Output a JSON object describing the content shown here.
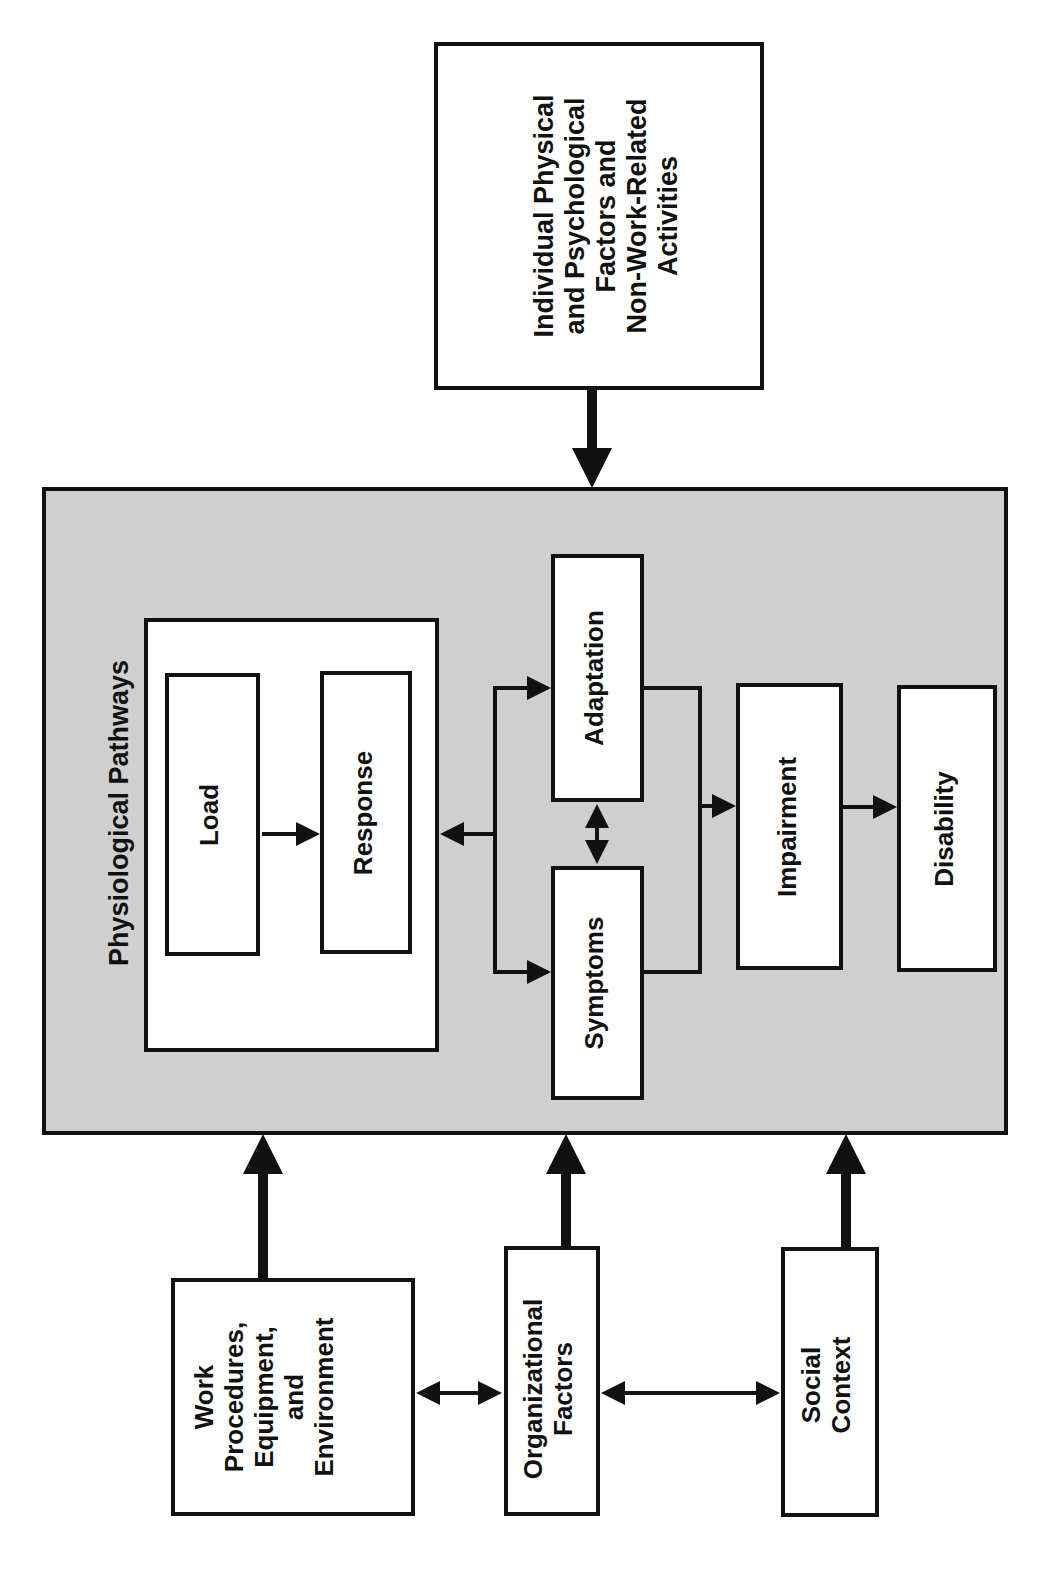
{
  "diagram": {
    "orientation": "rotated -90deg",
    "container": {
      "title": "Physiological Pathways",
      "fill": "#cfcfcf"
    },
    "nodes": {
      "individual": "Individual Physical\nand Psychological\nFactors and\nNon-Work-Related\nActivities",
      "load": "Load",
      "response": "Response",
      "adaptation": "Adaptation",
      "symptoms": "Symptoms",
      "impairment": "Impairment",
      "disability": "Disability",
      "work": "Work\nProcedures,\nEquipment,\nand\nEnvironment",
      "organizational": "Organizational\nFactors",
      "social": "Social\nContext"
    },
    "edges": [
      {
        "from": "individual",
        "to": "physiological-pathways",
        "style": "thick"
      },
      {
        "from": "work",
        "to": "physiological-pathways",
        "style": "thick"
      },
      {
        "from": "organizational",
        "to": "physiological-pathways",
        "style": "thick"
      },
      {
        "from": "social",
        "to": "physiological-pathways",
        "style": "thick"
      },
      {
        "from": "load",
        "to": "response"
      },
      {
        "from": "branch",
        "to": "response"
      },
      {
        "from": "branch",
        "to": "adaptation"
      },
      {
        "from": "branch",
        "to": "symptoms"
      },
      {
        "from": "adaptation",
        "to": "symptoms",
        "bidirectional": true
      },
      {
        "from": "adaptation+symptoms",
        "to": "impairment"
      },
      {
        "from": "impairment",
        "to": "disability"
      },
      {
        "from": "work",
        "to": "organizational",
        "bidirectional": true
      },
      {
        "from": "organizational",
        "to": "social",
        "bidirectional": true
      }
    ]
  }
}
